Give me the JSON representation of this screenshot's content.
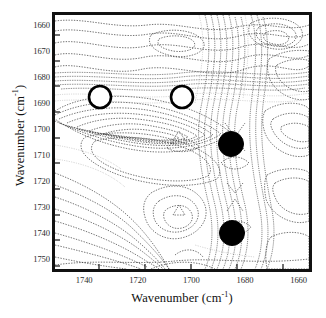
{
  "figure": {
    "kind": "2d-contour-spectrum",
    "background_color": "#ffffff",
    "frame_color": "#111111"
  },
  "axes": {
    "x_title_text": "Wavenumber (cm",
    "x_title_exponent": "-1",
    "x_title_close": ")",
    "y_title_text": "Wavenumber (cm",
    "y_title_exponent": "-1",
    "y_title_close": ")"
  },
  "chart_data": {
    "type": "heatmap",
    "title": "",
    "xlabel": "Wavenumber (cm-1)",
    "ylabel": "Wavenumber (cm-1)",
    "xlim": [
      1752,
      1655
    ],
    "ylim": [
      1655,
      1755
    ],
    "x_inverted": true,
    "y_inverted": true,
    "grid": false,
    "legend": "none",
    "xticks": [
      1740,
      1720,
      1700,
      1680,
      1660
    ],
    "xticklabels": [
      "1740",
      "1720",
      "1700",
      "1680",
      "1660"
    ],
    "yticks": [
      1660,
      1670,
      1680,
      1690,
      1700,
      1710,
      1720,
      1730,
      1740,
      1750
    ],
    "yticklabels": [
      "1660",
      "1670",
      "1680",
      "1690",
      "1700",
      "1710",
      "1720",
      "1730",
      "1740",
      "1750"
    ],
    "contour_style": "dashed-grayscale-lines",
    "markers": [
      {
        "id": "open-circle-1",
        "x": 1740,
        "y": 1687,
        "style": "open",
        "fill": "#ffffff",
        "stroke": "#000000"
      },
      {
        "id": "open-circle-2",
        "x": 1705,
        "y": 1687,
        "style": "open",
        "fill": "#ffffff",
        "stroke": "#000000"
      },
      {
        "id": "filled-circle-1",
        "x": 1684,
        "y": 1706,
        "style": "filled",
        "fill": "#000000",
        "stroke": "#000000"
      },
      {
        "id": "filled-circle-2",
        "x": 1684,
        "y": 1741,
        "style": "filled",
        "fill": "#000000",
        "stroke": "#000000"
      }
    ]
  }
}
